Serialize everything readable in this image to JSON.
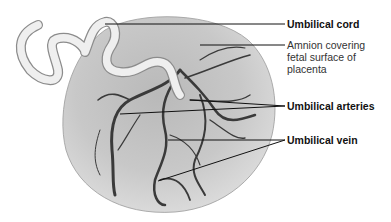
{
  "figure": {
    "labels": {
      "umbilical_cord": "Umbilical cord",
      "amnion_line1": "Amnion covering",
      "amnion_line2": "fetal surface of",
      "amnion_line3": "placenta",
      "umbilical_arteries": "Umbilical arteries",
      "umbilical_vein": "Umbilical vein"
    },
    "colors": {
      "placenta_fill": "#c9c9c9",
      "vessel": "#3a3a3a",
      "cord": "#ececec",
      "leader_line": "#111111"
    }
  }
}
